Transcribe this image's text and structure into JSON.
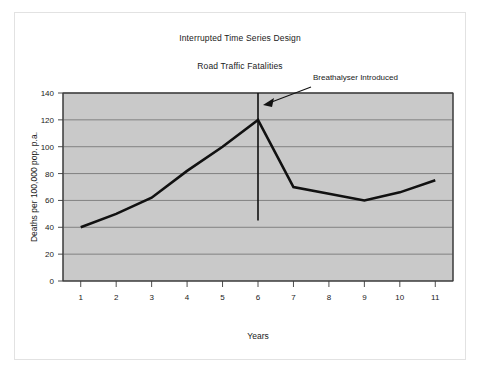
{
  "figure": {
    "title": "Interrupted Time Series Design",
    "subtitle": "Road Traffic Fatalities"
  },
  "chart_data": {
    "type": "line",
    "title": "Interrupted Time Series Design",
    "subtitle": "Road Traffic Fatalities",
    "xlabel": "Years",
    "ylabel": "Deaths per 100,000 pop. p.a.",
    "x": [
      1,
      2,
      3,
      4,
      5,
      6,
      7,
      8,
      9,
      10,
      11
    ],
    "categories": [
      "1",
      "2",
      "3",
      "4",
      "5",
      "6",
      "7",
      "8",
      "9",
      "10",
      "11"
    ],
    "values": [
      40,
      50,
      62,
      82,
      100,
      120,
      70,
      65,
      60,
      66,
      75
    ],
    "series": [
      {
        "name": "Road traffic fatalities",
        "values": [
          40,
          50,
          62,
          82,
          100,
          120,
          70,
          65,
          60,
          66,
          75
        ]
      }
    ],
    "ylim": [
      0,
      140
    ],
    "yticks": [
      0,
      20,
      40,
      60,
      80,
      100,
      120,
      140
    ],
    "ytick_labels": [
      "0",
      "20",
      "40",
      "60",
      "80",
      "100",
      "120",
      "140"
    ],
    "xlim": [
      0.5,
      11.5
    ],
    "grid": true,
    "legend": "none",
    "annotations": [
      {
        "label": "Breathalyser Introduced",
        "type": "vertical-line-with-arrow",
        "x": 6,
        "line_top_value": 140,
        "line_bottom_value": 45
      }
    ],
    "colors": {
      "line": "#111111",
      "plot_background": "#c9c9c9",
      "grid": "#6e6e6e",
      "axis": "#3a3a3a",
      "figure_background": "#ffffff"
    }
  }
}
